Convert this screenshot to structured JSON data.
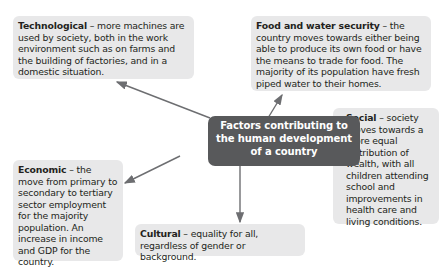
{
  "center": {
    "label": "Factors contributing to the human development of a country",
    "lines": [
      "Factors contributing to",
      "the human development",
      "of a country"
    ]
  },
  "factors": [
    {
      "id": "technological",
      "title": "Technological",
      "separator": " – ",
      "text": "more machines are used by society, both in the work environment such as on farms and the building of factories, and in a domestic situation."
    },
    {
      "id": "food-water",
      "title": "Food and water security",
      "separator": " – ",
      "text": "the country moves towards either being able to produce its own food or have the means to trade for food. The majority of its population have fresh piped water to their homes."
    },
    {
      "id": "social",
      "title": "Social",
      "separator": " – ",
      "text": "society moves towards a more equal distribution of wealth, with all children attending school and improvements in health care and living conditions."
    },
    {
      "id": "economic",
      "title": "Economic",
      "separator": " – ",
      "text": "the move from primary to secondary to tertiary sector employment for the majority population. An increase in income and GDP for the country."
    },
    {
      "id": "cultural",
      "title": "Cultural",
      "separator": " – ",
      "text": "equality for all, regardless of gender or background."
    }
  ],
  "colors": {
    "box_fill": "#e8e8e9",
    "center_fill": "#58595b",
    "arrow": "#6d6e71",
    "text": "#231f20"
  }
}
